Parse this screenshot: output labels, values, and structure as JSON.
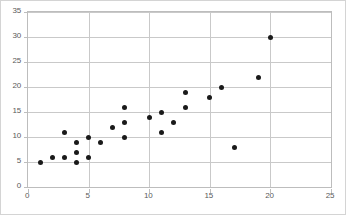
{
  "chart_data": {
    "type": "scatter",
    "title": "",
    "xlabel": "",
    "ylabel": "",
    "xlim": [
      0,
      25
    ],
    "ylim": [
      0,
      35
    ],
    "xticks": [
      0,
      5,
      10,
      15,
      20,
      25
    ],
    "yticks": [
      0,
      5,
      10,
      15,
      20,
      25,
      30,
      35
    ],
    "grid": true,
    "legend": false,
    "marker_color": "#1a1a1a",
    "gridline_color": "#c9c9c9",
    "border_color": "#bdbdbd",
    "points": [
      {
        "x": 1,
        "y": 5
      },
      {
        "x": 2,
        "y": 6
      },
      {
        "x": 3,
        "y": 6
      },
      {
        "x": 3,
        "y": 11
      },
      {
        "x": 4,
        "y": 5
      },
      {
        "x": 4,
        "y": 7
      },
      {
        "x": 4,
        "y": 9
      },
      {
        "x": 5,
        "y": 6
      },
      {
        "x": 5,
        "y": 10
      },
      {
        "x": 6,
        "y": 9
      },
      {
        "x": 7,
        "y": 12
      },
      {
        "x": 8,
        "y": 10
      },
      {
        "x": 8,
        "y": 13
      },
      {
        "x": 8,
        "y": 16
      },
      {
        "x": 10,
        "y": 14
      },
      {
        "x": 11,
        "y": 11
      },
      {
        "x": 11,
        "y": 15
      },
      {
        "x": 12,
        "y": 13
      },
      {
        "x": 13,
        "y": 16
      },
      {
        "x": 13,
        "y": 19
      },
      {
        "x": 15,
        "y": 18
      },
      {
        "x": 16,
        "y": 20
      },
      {
        "x": 17,
        "y": 8
      },
      {
        "x": 19,
        "y": 22
      },
      {
        "x": 20,
        "y": 30
      }
    ]
  }
}
